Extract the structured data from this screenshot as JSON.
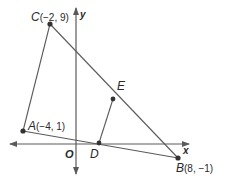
{
  "figure": {
    "type": "coordinate-geometry",
    "colors": {
      "line": "#5a5a5a",
      "point": "#333333",
      "text": "#2a2a2a"
    },
    "axes": {
      "x_label": "x",
      "y_label": "y",
      "origin_label": "O"
    },
    "points": [
      {
        "name": "C",
        "coords": "(−2, 9)",
        "x": -2,
        "y": 9
      },
      {
        "name": "A",
        "coords": "(−4, 1)",
        "x": -4,
        "y": 1
      },
      {
        "name": "B",
        "coords": "(8, −1)",
        "x": 8,
        "y": -1
      },
      {
        "name": "D",
        "coords": ""
      },
      {
        "name": "E",
        "coords": ""
      }
    ],
    "segments": [
      "CA",
      "AB",
      "CB",
      "DE"
    ]
  }
}
